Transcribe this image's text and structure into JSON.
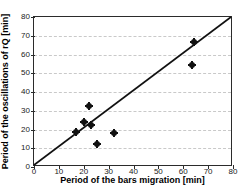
{
  "chart_data": {
    "type": "scatter",
    "title": "",
    "xlabel": "Period of the bars migration [min]",
    "ylabel": "Period of the oscillations of rQ [min]",
    "xlim": [
      0,
      80
    ],
    "ylim": [
      0,
      80
    ],
    "xticks": [
      0,
      10,
      20,
      30,
      40,
      50,
      60,
      70,
      80
    ],
    "yticks": [
      0,
      10,
      20,
      30,
      40,
      50,
      60,
      70,
      80
    ],
    "xtick_labels": [
      "0",
      "10",
      "20",
      "30",
      "40",
      "50",
      "60",
      "70",
      "80"
    ],
    "ytick_labels": [
      "0",
      "10",
      "20",
      "30",
      "40",
      "50",
      "60",
      "70",
      "80"
    ],
    "grid": "horizontal-dashed",
    "legend": "none",
    "marker_color": "#111111",
    "line_color": "#111111",
    "grid_color": "#c9c9c9",
    "axis_color": "#2b2b2b",
    "series": [
      {
        "name": "observations",
        "marker": "filled-diamond-circle",
        "points": [
          {
            "x": 17.0,
            "y": 18.5
          },
          {
            "x": 20.0,
            "y": 24.0
          },
          {
            "x": 22.0,
            "y": 32.3
          },
          {
            "x": 23.0,
            "y": 22.5
          },
          {
            "x": 25.5,
            "y": 12.3
          },
          {
            "x": 32.0,
            "y": 18.3
          },
          {
            "x": 63.5,
            "y": 54.5
          },
          {
            "x": 64.5,
            "y": 66.5
          }
        ]
      }
    ],
    "reference_line": {
      "name": "1:1 line",
      "from": {
        "x": 0,
        "y": 0
      },
      "to": {
        "x": 80,
        "y": 80
      }
    }
  }
}
